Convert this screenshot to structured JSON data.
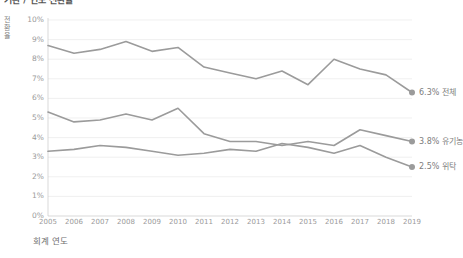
{
  "chart_data": {
    "type": "line",
    "title": "기관 / 연도 전환율",
    "xlabel": "회계 연도",
    "ylabel": "전환율",
    "ylabel_chars": [
      "전",
      "환",
      "율"
    ],
    "categories": [
      2005,
      2006,
      2007,
      2008,
      2009,
      2010,
      2011,
      2012,
      2013,
      2014,
      2015,
      2016,
      2017,
      2018,
      2019
    ],
    "xtick_labels": [
      "2005",
      "2006",
      "2007",
      "2008",
      "2009",
      "2010",
      "2011",
      "2012",
      "2013",
      "2014",
      "2015",
      "2016",
      "2017",
      "2018",
      "2019"
    ],
    "ytick_labels": [
      "10%",
      "9%",
      "8%",
      "7%",
      "6%",
      "5%",
      "4%",
      "3%",
      "2%",
      "1%",
      "0%"
    ],
    "ytick_values": [
      10,
      9,
      8,
      7,
      6,
      5,
      4,
      3,
      2,
      1,
      0
    ],
    "ylim": [
      0,
      10
    ],
    "xlim": [
      2005,
      2019
    ],
    "grid": true,
    "legend_position": "right-inline",
    "series": [
      {
        "name": "전체",
        "end_label": "6.3% 전체",
        "end_value": "6.3%",
        "color": "#9b9b9b",
        "values": [
          8.7,
          8.3,
          8.5,
          8.9,
          8.4,
          8.6,
          7.6,
          7.3,
          7.0,
          7.4,
          6.7,
          8.0,
          7.5,
          7.2,
          6.3
        ]
      },
      {
        "name": "유기농",
        "end_label": "3.8% 유기농",
        "end_value": "3.8%",
        "color": "#9b9b9b",
        "values": [
          5.3,
          4.8,
          4.9,
          5.2,
          4.9,
          5.5,
          4.2,
          3.8,
          3.8,
          3.6,
          3.8,
          3.6,
          4.4,
          4.1,
          3.8
        ]
      },
      {
        "name": "위탁",
        "end_label": "2.5% 위탁",
        "end_value": "2.5%",
        "color": "#9b9b9b",
        "values": [
          3.3,
          3.4,
          3.6,
          3.5,
          3.3,
          3.1,
          3.2,
          3.4,
          3.3,
          3.7,
          3.5,
          3.2,
          3.6,
          3.0,
          2.5
        ]
      }
    ]
  }
}
